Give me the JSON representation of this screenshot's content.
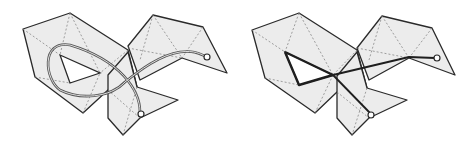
{
  "figures": [
    {
      "id": "left",
      "description": "Folded polyhedral surface with smooth curved path (geodesic loop) ending at endpoints",
      "path_style": "smooth double-line curve"
    },
    {
      "id": "right",
      "description": "Same folded polyhedral surface with straight-segment shortest path",
      "path_style": "bold polyline"
    }
  ],
  "colors": {
    "face": "#ececec",
    "edge": "#2a2a2a",
    "crease": "#7a7a7a",
    "path": "#3a3a3a",
    "background": "#ffffff"
  }
}
